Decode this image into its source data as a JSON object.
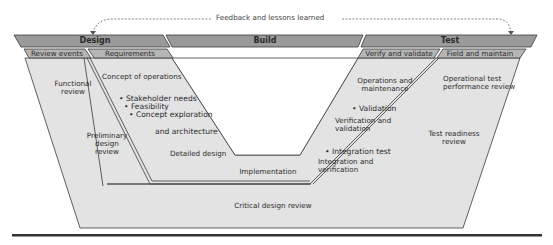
{
  "feedback": {
    "label": "Feedback and lessons learned"
  },
  "phases": {
    "design": "Design",
    "build": "Build",
    "test": "Test"
  },
  "subphases": {
    "review_events": "Review events",
    "requirements": "Requirements",
    "verify_validate": "Verify and validate",
    "field_maintain": "Field and maintain"
  },
  "review_events": {
    "functional_review": [
      "Functional",
      "review"
    ],
    "preliminary_design_review": [
      "Preliminary",
      "design",
      "review"
    ],
    "critical_design_review": "Critical design review",
    "test_readiness_review": [
      "Test readiness",
      "review"
    ],
    "operational_test_review": [
      "Operational test",
      "performance review"
    ]
  },
  "left_arm": {
    "concept_of_operations": "Concept of operations",
    "bullets": [
      "• Stakeholder needs",
      "• Feasibility",
      "• Concept exploration"
    ],
    "and_architecture": "and architecture",
    "detailed_design": "Detailed design"
  },
  "bottom": {
    "implementation": "Implementation"
  },
  "right_arm": {
    "operations_maintenance": [
      "Operations and",
      "maintenance"
    ],
    "validation_bullet": "• Validation",
    "verification_validation": [
      "Verification and",
      "validation"
    ],
    "integration_test_bullet": "• Integration test",
    "integration_verification": [
      "Integration and",
      "verification"
    ]
  },
  "colors": {
    "header_fill": "#9a9a9a",
    "subheader_fill": "#b5b5b5",
    "body_fill": "#e3e3e3",
    "outline": "#3a3a3a",
    "text": "#2b2b2b",
    "rule": "#333333"
  }
}
